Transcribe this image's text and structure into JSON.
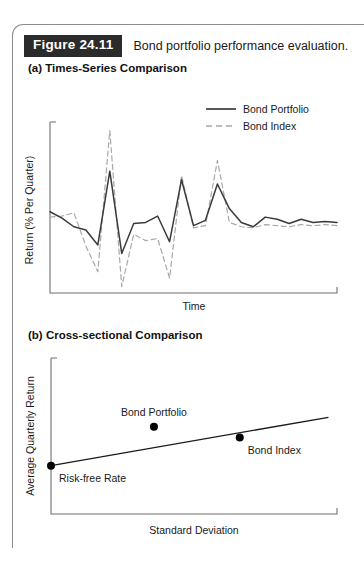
{
  "figure": {
    "tag": "Figure 24.11",
    "caption": "Bond portfolio performance evaluation."
  },
  "panels": [
    {
      "id": "a",
      "title": "(a) Times-Series Comparison"
    },
    {
      "id": "b",
      "title": "(b) Cross-sectional Comparison"
    }
  ],
  "colors": {
    "tag_background": "#2b2b2b",
    "tag_text": "#ffffff",
    "frame": "#8c8c8c",
    "axis": "#6f6f6f",
    "portfolio_line": "#3a3a3a",
    "index_line": "#a8a8a8",
    "point_fill": "#000000",
    "text": "#1a1a1a"
  },
  "chart_data": [
    {
      "type": "line",
      "panel": "a",
      "title": "(a) Times-Series Comparison",
      "xlabel": "Time",
      "ylabel": "Return (% Per Quarter)",
      "grid": false,
      "legend_position": "top-right",
      "xlim": [
        0,
        24
      ],
      "ylim": [
        -6,
        10
      ],
      "x": [
        0,
        1,
        2,
        3,
        4,
        5,
        6,
        7,
        8,
        9,
        10,
        11,
        12,
        13,
        14,
        15,
        16,
        17,
        18,
        19,
        20,
        21,
        22,
        23,
        24
      ],
      "series": [
        {
          "name": "Bond Portfolio",
          "style": "solid",
          "color": "#3a3a3a",
          "values": [
            1.6,
            1.0,
            0.2,
            -0.1,
            -1.5,
            5.4,
            -2.3,
            0.5,
            0.6,
            1.2,
            -1.2,
            4.6,
            0.3,
            0.8,
            4.2,
            1.9,
            0.6,
            0.2,
            1.1,
            0.9,
            0.5,
            0.9,
            0.6,
            0.7,
            0.6
          ]
        },
        {
          "name": "Bond Index",
          "style": "dashed",
          "color": "#a8a8a8",
          "values": [
            1.1,
            1.2,
            1.5,
            -1.6,
            -4.0,
            9.2,
            -5.4,
            -0.5,
            -1.1,
            -0.9,
            -4.6,
            5.0,
            0.1,
            0.3,
            6.4,
            0.6,
            0.2,
            0.1,
            0.4,
            0.3,
            0.2,
            0.4,
            0.3,
            0.4,
            0.3
          ]
        }
      ],
      "legend": [
        "Bond Portfolio",
        "Bond Index"
      ]
    },
    {
      "type": "scatter",
      "panel": "b",
      "title": "(b) Cross-sectional Comparison",
      "xlabel": "Standard Deviation",
      "ylabel": "Average Quarterly Return",
      "grid": false,
      "xlim": [
        0,
        10
      ],
      "ylim": [
        0,
        10
      ],
      "points": [
        {
          "label": "Risk-free Rate",
          "x": 0.0,
          "y": 3.1,
          "label_position": "below-right"
        },
        {
          "label": "Bond Portfolio",
          "x": 3.6,
          "y": 5.6,
          "label_position": "above"
        },
        {
          "label": "Bond Index",
          "x": 6.6,
          "y": 4.9,
          "label_position": "below-right"
        }
      ],
      "line": {
        "name": "Market line",
        "from": {
          "x": 0.0,
          "y": 3.1
        },
        "to": {
          "x": 9.7,
          "y": 6.2
        }
      }
    }
  ]
}
